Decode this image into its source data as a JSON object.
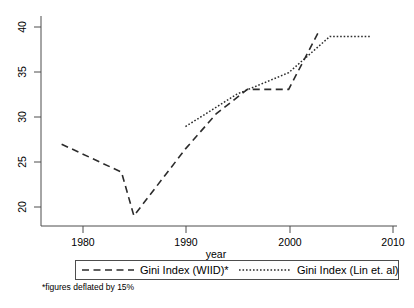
{
  "chart_data": {
    "type": "line",
    "title": "",
    "subtitle": "",
    "xlabel": "year",
    "ylabel": "",
    "xlim": [
      1976,
      2010.5
    ],
    "ylim": [
      18.2,
      40.8
    ],
    "xticks": [
      1980,
      1990,
      2000,
      2010
    ],
    "xtick_labels": [
      "1980",
      "1990",
      "2000",
      "2010"
    ],
    "yticks": [
      20,
      25,
      30,
      35,
      40
    ],
    "ytick_labels": [
      "20",
      "25",
      "30",
      "35",
      "40"
    ],
    "grid": false,
    "legend_position": "bottom",
    "annotations": [
      "*figures deflated by 15%"
    ],
    "series": [
      {
        "name": "Gini Index (WIID)*",
        "style": "dashed",
        "color": "#2b2b2b",
        "x": [
          1978,
          1983.8,
          1985,
          1990,
          1993,
          1996,
          2000,
          2003
        ],
        "values": [
          27.0,
          24.0,
          19.3,
          26.5,
          30.3,
          32.9,
          32.9,
          39.3
        ]
      },
      {
        "name": "Gini Index (Lin et. al)",
        "style": "dotted",
        "color": "#2b2b2b",
        "x": [
          1990,
          1995,
          2000,
          2004,
          2008
        ],
        "values": [
          28.9,
          32.4,
          34.7,
          38.6,
          38.6
        ]
      }
    ]
  },
  "axis": {
    "xlabel": "year",
    "xtick_labels": [
      "1980",
      "1990",
      "2000",
      "2010"
    ],
    "ytick_labels": [
      "20",
      "25",
      "30",
      "35",
      "40"
    ]
  },
  "legend": {
    "entries": [
      {
        "label": "Gini Index (WIID)*",
        "style": "dashed"
      },
      {
        "label": "Gini Index (Lin et. al)",
        "style": "dotted"
      }
    ]
  },
  "footnote": {
    "text": "*figures deflated by 15%"
  }
}
